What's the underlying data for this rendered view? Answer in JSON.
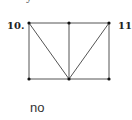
{
  "top_fragment": "y",
  "figure": {
    "left_label": "10.",
    "right_label": "11",
    "vertices": [
      {
        "id": "A",
        "x": 29,
        "y": 23
      },
      {
        "id": "B",
        "x": 69,
        "y": 23
      },
      {
        "id": "C",
        "x": 109,
        "y": 23
      },
      {
        "id": "D",
        "x": 29,
        "y": 79
      },
      {
        "id": "E",
        "x": 69,
        "y": 79
      },
      {
        "id": "F",
        "x": 109,
        "y": 79
      }
    ],
    "edges": [
      [
        "A",
        "B"
      ],
      [
        "B",
        "C"
      ],
      [
        "D",
        "E"
      ],
      [
        "E",
        "F"
      ],
      [
        "A",
        "D"
      ],
      [
        "B",
        "E"
      ],
      [
        "C",
        "F"
      ],
      [
        "A",
        "E"
      ],
      [
        "C",
        "E"
      ]
    ],
    "line_color": "#555555",
    "dot_color": "#111111"
  },
  "answer": "no"
}
